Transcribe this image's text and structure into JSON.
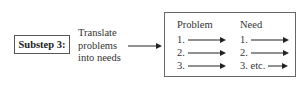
{
  "substep": {
    "label": "Substep 3:"
  },
  "description": {
    "lines": [
      "Translate",
      "problems",
      "into needs"
    ]
  },
  "result": {
    "columns": [
      {
        "header": "Problem",
        "items": [
          "1.",
          "2.",
          "3."
        ]
      },
      {
        "header": "Need",
        "items": [
          "1.",
          "2.",
          "3. etc."
        ]
      }
    ]
  }
}
